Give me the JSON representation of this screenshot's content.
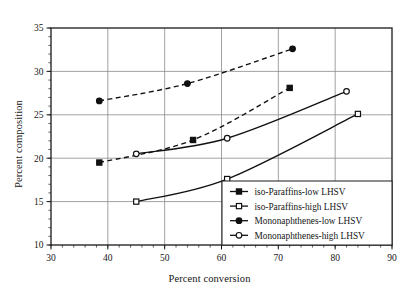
{
  "chart_data": {
    "type": "line",
    "title": "",
    "xlabel": "Percent conversion",
    "ylabel": "Percent composition",
    "xlim": [
      30,
      90
    ],
    "ylim": [
      10,
      35
    ],
    "xticks": [
      30,
      40,
      50,
      60,
      70,
      80,
      90
    ],
    "yticks": [
      10,
      15,
      20,
      25,
      30,
      35
    ],
    "xtick_labels": [
      "30",
      "40",
      "50",
      "60",
      "70",
      "80",
      "90"
    ],
    "ytick_labels": [
      "10",
      "15",
      "20",
      "25",
      "30",
      "35"
    ],
    "x_minor_step": 2,
    "y_minor_step": 1,
    "grid": true,
    "grid_color": "#8a8a8a",
    "frame_color": "#1a1a1a",
    "legend_position": "lower right",
    "series": [
      {
        "name": "iso-Paraffins-low LHSV",
        "marker": "filled-square",
        "linestyle": "dashed",
        "color": "#111111",
        "points": [
          {
            "x": 38.5,
            "y": 19.5
          },
          {
            "x": 55.0,
            "y": 22.1
          },
          {
            "x": 72.0,
            "y": 28.1
          }
        ]
      },
      {
        "name": "iso-Paraffins-high LHSV",
        "marker": "open-square",
        "linestyle": "solid",
        "color": "#111111",
        "points": [
          {
            "x": 45.0,
            "y": 15.0
          },
          {
            "x": 61.0,
            "y": 17.6
          },
          {
            "x": 84.0,
            "y": 25.1
          }
        ]
      },
      {
        "name": "Mononaphthenes-low LHSV",
        "marker": "filled-circle",
        "linestyle": "dashed",
        "color": "#111111",
        "points": [
          {
            "x": 38.5,
            "y": 26.6
          },
          {
            "x": 54.0,
            "y": 28.6
          },
          {
            "x": 72.5,
            "y": 32.6
          }
        ]
      },
      {
        "name": "Mononaphthenes-high LHSV",
        "marker": "open-circle",
        "linestyle": "solid",
        "color": "#111111",
        "points": [
          {
            "x": 45.0,
            "y": 20.5
          },
          {
            "x": 61.0,
            "y": 22.3
          },
          {
            "x": 82.0,
            "y": 27.7
          }
        ]
      }
    ],
    "legend_entries": [
      "iso-Paraffins-low LHSV",
      "iso-Paraffins-high LHSV",
      "Mononaphthenes-low LHSV",
      "Mononaphthenes-high LHSV"
    ]
  }
}
